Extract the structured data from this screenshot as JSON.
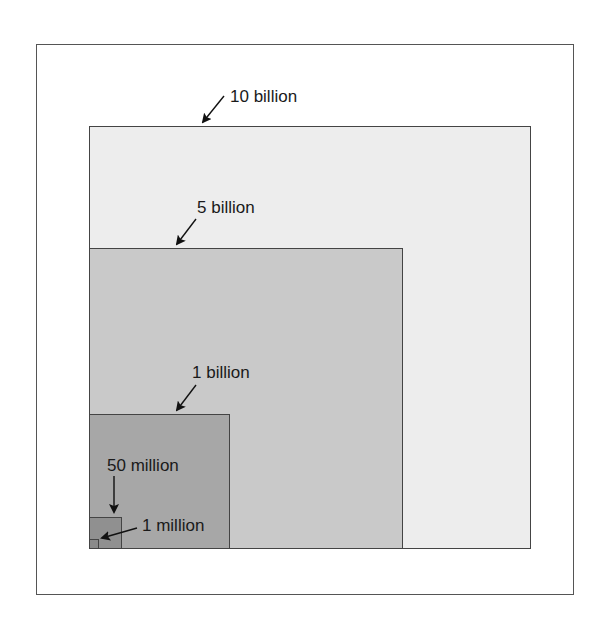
{
  "diagram": {
    "type": "nested-squares",
    "colors": {
      "frame_border": "#555555",
      "box_border": "#444444",
      "ten_billion_fill": "#ededed",
      "five_billion_fill": "#c9c9c9",
      "one_billion_fill": "#a7a7a7",
      "fifty_million_fill": "#909090",
      "one_million_fill": "#8a8a8a"
    },
    "boxes": [
      {
        "id": "ten-billion",
        "label": "10 billion"
      },
      {
        "id": "five-billion",
        "label": "5 billion"
      },
      {
        "id": "one-billion",
        "label": "1 billion"
      },
      {
        "id": "fifty-million",
        "label": "50 million"
      },
      {
        "id": "one-million",
        "label": "1 million"
      }
    ]
  }
}
